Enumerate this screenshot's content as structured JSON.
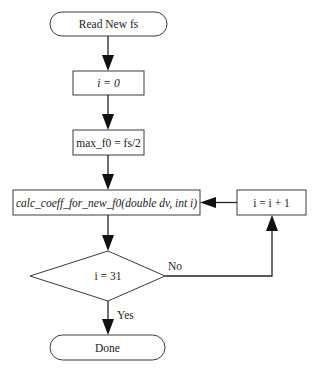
{
  "diagram": {
    "type": "flowchart",
    "nodes": {
      "start": {
        "kind": "terminator",
        "label": "Read New fs"
      },
      "init_i": {
        "kind": "process",
        "label": "i = 0",
        "italic": true
      },
      "max_f0": {
        "kind": "process",
        "label": "max_f0 = fs/2"
      },
      "calc": {
        "kind": "process",
        "label": "calc_coeff_for_new_f0(double dv, int i)",
        "italic": true
      },
      "increment": {
        "kind": "process",
        "label": "i = i + 1"
      },
      "decision": {
        "kind": "decision",
        "label": "i = 31"
      },
      "end": {
        "kind": "terminator",
        "label": "Done"
      }
    },
    "edges": [
      {
        "from": "start",
        "to": "init_i",
        "label": ""
      },
      {
        "from": "init_i",
        "to": "max_f0",
        "label": ""
      },
      {
        "from": "max_f0",
        "to": "calc",
        "label": ""
      },
      {
        "from": "calc",
        "to": "decision",
        "label": ""
      },
      {
        "from": "decision",
        "to": "increment",
        "label": "No"
      },
      {
        "from": "increment",
        "to": "calc",
        "label": ""
      },
      {
        "from": "decision",
        "to": "end",
        "label": "Yes"
      }
    ],
    "edge_labels": {
      "no": "No",
      "yes": "Yes"
    },
    "colors": {
      "stroke": "#3a3a3a",
      "arrow": "#111111",
      "text": "#222222",
      "background": "#ffffff"
    }
  }
}
